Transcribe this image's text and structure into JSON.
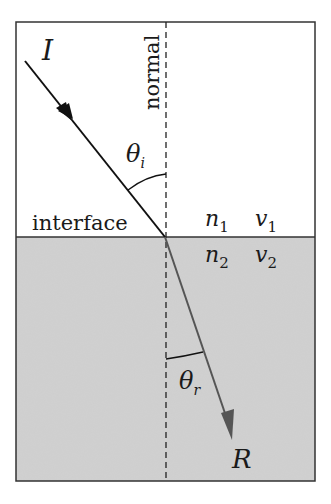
{
  "diagram": {
    "labels": {
      "incident": "I",
      "refracted": "R",
      "normal": "normal",
      "interface": "interface",
      "theta": "θ",
      "incident_angle_sub": "i",
      "refracted_angle_sub": "r",
      "n": "n",
      "v": "v",
      "medium1_sub": "1",
      "medium2_sub": "2"
    },
    "colors": {
      "medium1": "#ffffff",
      "medium2": "#d4d4d4",
      "border": "#333333",
      "incident_ray": "#111111",
      "refracted_ray": "#555555"
    }
  }
}
